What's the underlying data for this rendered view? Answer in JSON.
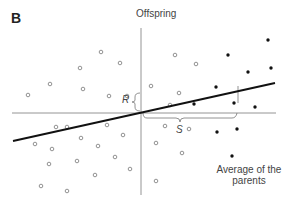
{
  "panel": {
    "label": "B"
  },
  "axes": {
    "y_label": "Offspring",
    "x_label": "Average of the parents"
  },
  "annotations": {
    "R_label": "R",
    "S_label": "S",
    "R_meaning": "response to selection (offspring deviation)",
    "S_meaning": "selection differential (parental deviation)"
  },
  "colors": {
    "axis": "#888888",
    "regression_line": "#111111",
    "unselected_point_stroke": "#777777",
    "selected_point_fill": "#111111",
    "text": "#444444"
  },
  "chart_data": {
    "type": "scatter",
    "title": "",
    "xlabel": "Average of the parents",
    "ylabel": "Offspring",
    "grid": false,
    "origin_px": [
      141,
      113
    ],
    "series": [
      {
        "name": "unselected parents (open circles)",
        "marker": "open-circle",
        "points_px": [
          [
            28,
            95
          ],
          [
            50,
            84
          ],
          [
            80,
            68
          ],
          [
            83,
            89
          ],
          [
            101,
            52
          ],
          [
            120,
            63
          ],
          [
            109,
            96
          ],
          [
            127,
            96
          ],
          [
            56,
            127
          ],
          [
            67,
            127
          ],
          [
            107,
            125
          ],
          [
            123,
            135
          ],
          [
            35,
            144
          ],
          [
            52,
            149
          ],
          [
            81,
            138
          ],
          [
            98,
            146
          ],
          [
            49,
            164
          ],
          [
            77,
            161
          ],
          [
            115,
            157
          ],
          [
            130,
            169
          ],
          [
            95,
            175
          ],
          [
            41,
            186
          ],
          [
            67,
            191
          ],
          [
            175,
            55
          ],
          [
            196,
            64
          ],
          [
            151,
            86
          ],
          [
            179,
            93
          ],
          [
            170,
            105
          ],
          [
            165,
            126
          ],
          [
            189,
            129
          ],
          [
            156,
            143
          ],
          [
            182,
            153
          ],
          [
            156,
            181
          ]
        ]
      },
      {
        "name": "selected parents (filled dots)",
        "marker": "filled-dot",
        "points_px": [
          [
            228,
            55
          ],
          [
            268,
            40
          ],
          [
            248,
            72
          ],
          [
            271,
            68
          ],
          [
            216,
            87
          ],
          [
            194,
            104
          ],
          [
            234,
            103
          ],
          [
            255,
            107
          ],
          [
            217,
            132
          ],
          [
            237,
            129
          ],
          [
            232,
            156
          ]
        ]
      }
    ],
    "regression_line_px": [
      [
        13,
        141
      ],
      [
        275,
        83
      ]
    ],
    "selected_mean_marker_px": [
      237,
      96
    ]
  }
}
